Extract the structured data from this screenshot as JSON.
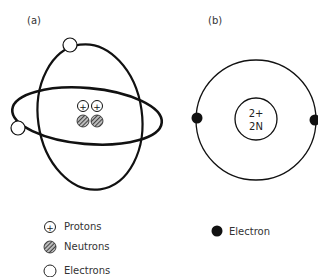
{
  "panels": {
    "a": {
      "label": "(a)",
      "nucleus": {
        "protons": 2,
        "neutrons": 2,
        "proton_symbol": "+"
      },
      "electrons": 2
    },
    "b": {
      "label": "(b)",
      "nucleus_charge": "2+",
      "nucleus_neutrons": "2N",
      "electrons": 2
    }
  },
  "legend_a": [
    {
      "icon": "proton-icon",
      "label": "Protons"
    },
    {
      "icon": "neutron-icon",
      "label": "Neutrons"
    },
    {
      "icon": "electron-open-icon",
      "label": "Electrons"
    }
  ],
  "legend_b": [
    {
      "icon": "electron-filled-icon",
      "label": "Electron"
    }
  ],
  "colors": {
    "stroke": "#111111",
    "background": "#ffffff"
  }
}
